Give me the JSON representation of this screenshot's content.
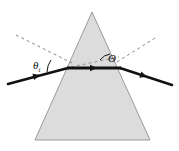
{
  "figure": {
    "background_color": "#ffffff",
    "width": 179,
    "height": 151
  },
  "prism": {
    "name": "triangular-prism",
    "shape": "triangle",
    "fill_color": "#dcdcdc",
    "stroke_color": "#9a9a9a",
    "apex": {
      "x": 92,
      "y": 12
    },
    "base_left": {
      "x": 35,
      "y": 140
    },
    "base_right": {
      "x": 150,
      "y": 140
    }
  },
  "rays": {
    "color": "#111111",
    "incident": {
      "label": "incident-ray",
      "from": {
        "x": 8,
        "y": 84
      },
      "to": {
        "x": 68,
        "y": 68
      },
      "arrow_at": {
        "x": 42,
        "y": 75
      }
    },
    "internal": {
      "label": "internal-ray",
      "from": {
        "x": 68,
        "y": 68
      },
      "to": {
        "x": 120,
        "y": 68
      },
      "arrow_at": {
        "x": 96,
        "y": 68
      }
    },
    "emergent": {
      "label": "emergent-ray",
      "from": {
        "x": 120,
        "y": 68
      },
      "to": {
        "x": 172,
        "y": 85
      },
      "arrow_at": {
        "x": 148,
        "y": 77
      }
    }
  },
  "normals": {
    "color": "#8a8a8a",
    "dash": "3 3",
    "left": {
      "label": "left-normal-dashed",
      "from": {
        "x": 16,
        "y": 35
      },
      "to": {
        "x": 72,
        "y": 63
      }
    },
    "right": {
      "label": "right-normal-dashed",
      "from": {
        "x": 116,
        "y": 63
      },
      "to": {
        "x": 154,
        "y": 38
      }
    },
    "inner": {
      "label": "inner-normal-dashed",
      "from": {
        "x": 70,
        "y": 66
      },
      "to": {
        "x": 118,
        "y": 57
      }
    }
  },
  "labels": {
    "incidence_angle": {
      "name": "theta-i-label",
      "text": "θ",
      "subscript": "i",
      "x": 36,
      "y": 66
    },
    "deviation_angle": {
      "name": "theta-capital-label",
      "text": "Θ",
      "x": 111,
      "y": 60
    }
  },
  "arcs": {
    "incidence_arc": {
      "name": "incidence-angle-arc",
      "color": "#111111"
    },
    "deviation_arc": {
      "name": "deviation-angle-arc",
      "color": "#111111"
    }
  }
}
